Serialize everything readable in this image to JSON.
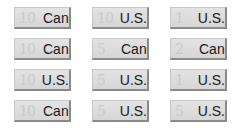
{
  "tiles": [
    {
      "number": "10",
      "label": "Can"
    },
    {
      "number": "10",
      "label": "U.S."
    },
    {
      "number": "1",
      "label": "U.S."
    },
    {
      "number": "10",
      "label": "Can"
    },
    {
      "number": "5",
      "label": "Can"
    },
    {
      "number": "2",
      "label": "Can"
    },
    {
      "number": "10",
      "label": "U.S."
    },
    {
      "number": "5",
      "label": "U.S."
    },
    {
      "number": "1",
      "label": "U.S."
    },
    {
      "number": "10",
      "label": "Can"
    },
    {
      "number": "5",
      "label": "U.S."
    },
    {
      "number": "5",
      "label": "U.S."
    }
  ]
}
